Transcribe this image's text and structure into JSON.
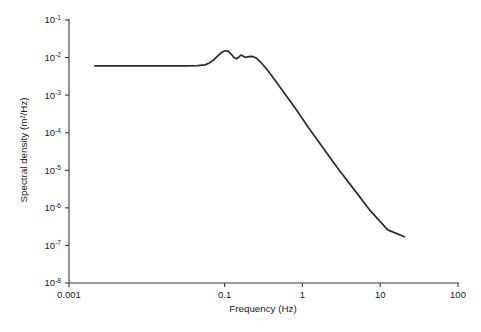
{
  "chart_data": {
    "type": "line",
    "title": "",
    "xlabel": "Frequency (Hz)",
    "ylabel": "Spectral density (m²/Hz)",
    "xscale": "log",
    "yscale": "log",
    "xlim": [
      0.001,
      100
    ],
    "ylim": [
      1e-08,
      0.1
    ],
    "grid": false,
    "legend": null,
    "xticks": [
      {
        "value": 0.001,
        "label": "0.001"
      },
      {
        "value": 0.1,
        "label": "0.1"
      },
      {
        "value": 1,
        "label": "1"
      },
      {
        "value": 10,
        "label": "10"
      },
      {
        "value": 100,
        "label": "100"
      }
    ],
    "yticks": [
      {
        "value": 0.1,
        "mantissa": "10",
        "exponent": "-1"
      },
      {
        "value": 0.01,
        "mantissa": "10",
        "exponent": "-2"
      },
      {
        "value": 0.001,
        "mantissa": "10",
        "exponent": "-3"
      },
      {
        "value": 0.0001,
        "mantissa": "10",
        "exponent": "-4"
      },
      {
        "value": 1e-05,
        "mantissa": "10",
        "exponent": "-5"
      },
      {
        "value": 1e-06,
        "mantissa": "10",
        "exponent": "-6"
      },
      {
        "value": 1e-07,
        "mantissa": "10",
        "exponent": "-7"
      },
      {
        "value": 1e-08,
        "mantissa": "10",
        "exponent": "-8"
      }
    ],
    "series": [
      {
        "name": "Wave spectral density",
        "color": "#2b2b2b",
        "x": [
          0.00215,
          0.0035,
          0.006,
          0.0105,
          0.018,
          0.03,
          0.045,
          0.056,
          0.064,
          0.072,
          0.08,
          0.088,
          0.096,
          0.104,
          0.112,
          0.122,
          0.132,
          0.142,
          0.152,
          0.162,
          0.172,
          0.184,
          0.198,
          0.215,
          0.235,
          0.26,
          0.29,
          0.33,
          0.39,
          0.48,
          0.62,
          0.85,
          1.2,
          1.8,
          2.8,
          4.5,
          7.5,
          12.5,
          20.5
        ],
        "y": [
          0.006,
          0.006,
          0.006,
          0.006,
          0.006,
          0.006,
          0.0061,
          0.0064,
          0.0072,
          0.0086,
          0.0106,
          0.0128,
          0.0145,
          0.0152,
          0.0146,
          0.0122,
          0.01,
          0.0093,
          0.0102,
          0.0117,
          0.011,
          0.0102,
          0.0104,
          0.0108,
          0.0106,
          0.0094,
          0.0076,
          0.0056,
          0.0036,
          0.002,
          0.00096,
          0.00039,
          0.000135,
          4.2e-05,
          1.18e-05,
          3.3e-06,
          8.3e-07,
          2.6e-07,
          1.7e-07
        ]
      }
    ],
    "annotations": []
  }
}
